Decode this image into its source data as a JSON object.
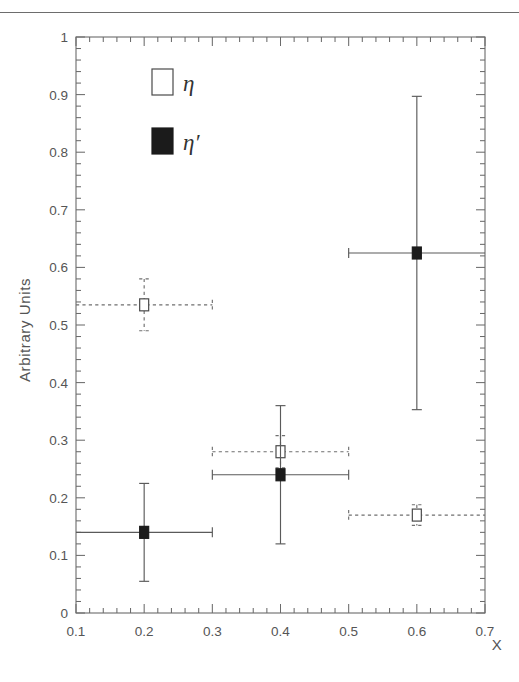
{
  "figure": {
    "top_rule": true,
    "background_color": "#ffffff",
    "axis_color": "#6b6b6b"
  },
  "chart_data": {
    "type": "scatter",
    "title": "",
    "xlabel": "X",
    "ylabel": "Arbitrary Units",
    "xlim": [
      0.1,
      0.7
    ],
    "ylim": [
      0,
      1
    ],
    "xticks": [
      0.1,
      0.2,
      0.3,
      0.4,
      0.5,
      0.6,
      0.7
    ],
    "xtick_labels": [
      "0.1",
      "0.2",
      "0.3",
      "0.4",
      "0.5",
      "0.6",
      "0.7"
    ],
    "yticks": [
      0,
      0.1,
      0.2,
      0.3,
      0.4,
      0.5,
      0.6,
      0.7,
      0.8,
      0.9,
      1
    ],
    "ytick_labels": [
      "0",
      "0.1",
      "0.2",
      "0.3",
      "0.4",
      "0.5",
      "0.6",
      "0.7",
      "0.8",
      "0.9",
      "1"
    ],
    "minor_ticks_per_major": 5,
    "grid": false,
    "legend_position": "upper-left-inside",
    "series": [
      {
        "name": "eta",
        "label": "η",
        "marker": "open-square",
        "linestyle": "dashed",
        "color": "#6f6f6f",
        "points": [
          {
            "x": 0.2,
            "y": 0.535,
            "xerr": 0.1,
            "yerr": 0.045
          },
          {
            "x": 0.4,
            "y": 0.28,
            "xerr": 0.1,
            "yerr": 0.028
          },
          {
            "x": 0.6,
            "y": 0.17,
            "xerr": 0.1,
            "yerr": 0.018
          }
        ]
      },
      {
        "name": "eta-prime",
        "label": "η′",
        "marker": "filled-square",
        "linestyle": "solid",
        "color": "#5a5a5a",
        "points": [
          {
            "x": 0.2,
            "y": 0.14,
            "xerr": 0.1,
            "yerr": 0.085
          },
          {
            "x": 0.4,
            "y": 0.24,
            "xerr": 0.1,
            "yerr": 0.12
          },
          {
            "x": 0.6,
            "y": 0.625,
            "xerr": 0.1,
            "yerr": 0.272
          }
        ]
      }
    ],
    "legend_entries": [
      {
        "marker": "open-square",
        "label": "η"
      },
      {
        "marker": "filled-square",
        "label": "η′"
      }
    ]
  }
}
